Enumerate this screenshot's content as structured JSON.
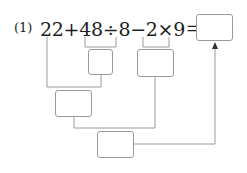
{
  "problem": {
    "number_label": "(1)",
    "expression": "22+48÷8−2×9＝",
    "tokens": [
      "22",
      "+",
      "48",
      "÷",
      "8",
      "−",
      "2",
      "×",
      "9",
      "＝"
    ]
  },
  "diagram": {
    "boxes": [
      {
        "id": "answer-box",
        "value": ""
      },
      {
        "id": "quotient-box",
        "value": "",
        "for": "48÷8"
      },
      {
        "id": "product-box",
        "value": "",
        "for": "2×9"
      },
      {
        "id": "sum-box",
        "value": "",
        "for": "22 + (48÷8)"
      },
      {
        "id": "difference-box",
        "value": "",
        "for": "sum − product"
      }
    ],
    "line_color": "#9a9a9a"
  }
}
